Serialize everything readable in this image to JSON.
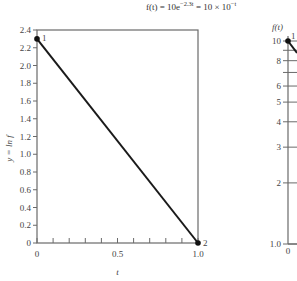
{
  "formula": "f(t) = 10e^{-2.3t} = 10 × 10^{-t}",
  "formula_parts": {
    "lhs": "f(t) = 10e",
    "exp1": "−2.3t",
    "mid": " = 10 × 10",
    "exp2": "−t"
  },
  "chart_data": [
    {
      "type": "line",
      "title": "",
      "xlabel": "t",
      "ylabel": "y = ln f",
      "xlim": [
        0,
        1.0
      ],
      "ylim": [
        0,
        2.4
      ],
      "x_ticks": [
        0,
        0.1,
        0.2,
        0.3,
        0.4,
        0.5,
        0.6,
        0.7,
        0.8,
        0.9,
        1.0
      ],
      "x_tick_labels": [
        "0",
        "0.5",
        "1.0"
      ],
      "y_ticks": [
        0,
        0.2,
        0.4,
        0.6,
        0.8,
        1.0,
        1.2,
        1.4,
        1.6,
        1.8,
        2.0,
        2.2,
        2.4
      ],
      "y_tick_labels": [
        "0",
        "0.2",
        "0.4",
        "0.6",
        "0.8",
        "1.0",
        "1.2",
        "1.4",
        "1.6",
        "1.8",
        "2.0",
        "2.2",
        "2.4"
      ],
      "grid": false,
      "series": [
        {
          "name": "ln f",
          "x": [
            0,
            1.0
          ],
          "y": [
            2.3,
            0
          ],
          "point_labels": [
            "1",
            "2"
          ]
        }
      ]
    },
    {
      "type": "line",
      "title": "",
      "xlabel": "",
      "ylabel": "f(t)",
      "y_scale": "log",
      "ylim": [
        1.0,
        10
      ],
      "x_tick_labels": [
        "0"
      ],
      "y_ticks": [
        1,
        2,
        3,
        4,
        5,
        6,
        7,
        8,
        9,
        10
      ],
      "y_tick_labels": [
        "1.0",
        "2",
        "3",
        "4",
        "5",
        "6",
        "8",
        "10"
      ],
      "grid": false,
      "series": [
        {
          "name": "f(t)",
          "x": [
            0
          ],
          "y": [
            10
          ],
          "point_labels": [
            "1"
          ]
        }
      ]
    }
  ]
}
